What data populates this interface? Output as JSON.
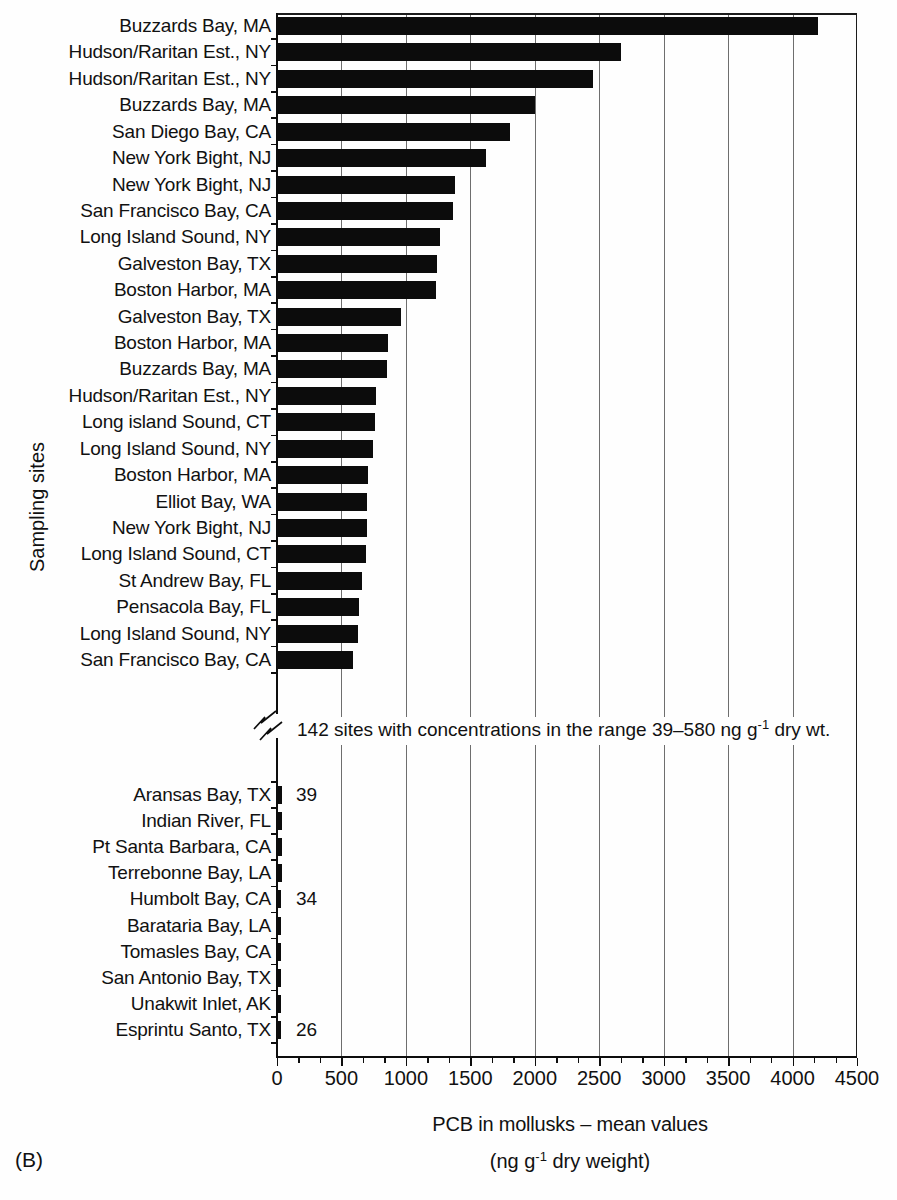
{
  "labels": {
    "figure_label": "(B)",
    "y_axis_title": "Sampling sites"
  },
  "x_axis": {
    "title": "PCB in mollusks – mean values",
    "units_prefix": "(ng g",
    "units_sup": "-1",
    "units_suffix": " dry weight)",
    "tick_labels": [
      "0",
      "500",
      "1000",
      "1500",
      "2000",
      "2500",
      "3000",
      "3500",
      "4000",
      "4500"
    ]
  },
  "break_note": {
    "prefix": "142 sites with concentrations in the range 39–580 ng g",
    "sup": "-1",
    "suffix": " dry wt."
  },
  "chart_data": {
    "type": "bar",
    "orientation": "horizontal",
    "title": "PCB in mollusks – mean values",
    "xlabel": "PCB in mollusks – mean values (ng g-1 dry weight)",
    "ylabel": "Sampling sites",
    "xlim": [
      0,
      4500
    ],
    "x_ticks": [
      0,
      500,
      1000,
      1500,
      2000,
      2500,
      3000,
      3500,
      4000,
      4500
    ],
    "minor_ticks_per_major": 2,
    "gridlines": "vertical at every 500",
    "bar_color": "#0c0c0c",
    "axis_break_note": "142 sites with concentrations in the range 39–580 ng g-1 dry wt.",
    "top_group": [
      {
        "site": "Buzzards Bay, MA",
        "value": 4200
      },
      {
        "site": "Hudson/Raritan Est., NY",
        "value": 2670
      },
      {
        "site": "Hudson/Raritan Est., NY",
        "value": 2450
      },
      {
        "site": "Buzzards Bay, MA",
        "value": 2005
      },
      {
        "site": "San Diego Bay, CA",
        "value": 1810
      },
      {
        "site": "New York Bight, NJ",
        "value": 1620
      },
      {
        "site": "New York Bight, NJ",
        "value": 1380
      },
      {
        "site": "San Francisco Bay, CA",
        "value": 1365
      },
      {
        "site": "Long Island Sound, NY",
        "value": 1265
      },
      {
        "site": "Galveston Bay, TX",
        "value": 1240
      },
      {
        "site": "Boston Harbor, MA",
        "value": 1230
      },
      {
        "site": "Galveston Bay, TX",
        "value": 960
      },
      {
        "site": "Boston Harbor, MA",
        "value": 860
      },
      {
        "site": "Buzzards Bay, MA",
        "value": 850
      },
      {
        "site": "Hudson/Raritan Est., NY",
        "value": 765
      },
      {
        "site": "Long island Sound, CT",
        "value": 760
      },
      {
        "site": "Long Island Sound, NY",
        "value": 745
      },
      {
        "site": "Boston Harbor, MA",
        "value": 705
      },
      {
        "site": "Elliot Bay, WA",
        "value": 700
      },
      {
        "site": "New York Bight, NJ",
        "value": 695
      },
      {
        "site": "Long Island Sound, CT",
        "value": 690
      },
      {
        "site": "St Andrew Bay, FL",
        "value": 660
      },
      {
        "site": "Pensacola Bay, FL",
        "value": 640
      },
      {
        "site": "Long Island Sound, NY",
        "value": 630
      },
      {
        "site": "San Francisco Bay, CA",
        "value": 590
      }
    ],
    "bottom_group": [
      {
        "site": "Aransas Bay, TX",
        "value": 39,
        "value_label": "39"
      },
      {
        "site": "Indian River, FL",
        "value": 38,
        "value_label": ""
      },
      {
        "site": "Pt Santa Barbara, CA",
        "value": 37,
        "value_label": ""
      },
      {
        "site": "Terrebonne Bay, LA",
        "value": 36,
        "value_label": ""
      },
      {
        "site": "Humbolt Bay, CA",
        "value": 34,
        "value_label": "34"
      },
      {
        "site": "Barataria Bay, LA",
        "value": 33,
        "value_label": ""
      },
      {
        "site": "Tomasles Bay, CA",
        "value": 32,
        "value_label": ""
      },
      {
        "site": "San Antonio Bay, TX",
        "value": 30,
        "value_label": ""
      },
      {
        "site": "Unakwit Inlet, AK",
        "value": 28,
        "value_label": ""
      },
      {
        "site": "Esprintu Santo, TX",
        "value": 26,
        "value_label": "26"
      }
    ]
  }
}
